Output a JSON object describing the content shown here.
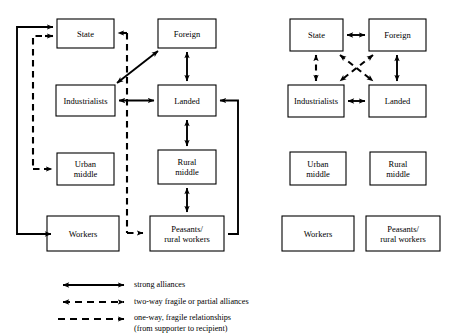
{
  "diagram": {
    "panels": [
      {
        "id": "left-panel",
        "name": "left-diagram",
        "nodes": [
          {
            "id": "state",
            "label": "State",
            "x": 57,
            "y": 19,
            "w": 57,
            "h": 29
          },
          {
            "id": "foreign",
            "label": "Foreign",
            "x": 158,
            "y": 19,
            "w": 58,
            "h": 29
          },
          {
            "id": "industrialists",
            "label": "Industrialists",
            "x": 56,
            "y": 85,
            "w": 59,
            "h": 31
          },
          {
            "id": "landed",
            "label": "Landed",
            "x": 158,
            "y": 85,
            "w": 58,
            "h": 31
          },
          {
            "id": "urban-middle",
            "label": "Urban\nmiddle",
            "x": 57,
            "y": 153,
            "w": 57,
            "h": 32
          },
          {
            "id": "rural-middle",
            "label": "Rural\nmiddle",
            "x": 158,
            "y": 150,
            "w": 58,
            "h": 34
          },
          {
            "id": "workers",
            "label": "Workers",
            "x": 47,
            "y": 216,
            "w": 72,
            "h": 35
          },
          {
            "id": "peasants",
            "label": "Peasants/\nrural workers",
            "x": 150,
            "y": 216,
            "w": 74,
            "h": 35
          }
        ],
        "edges": [
          {
            "from": "workers",
            "to": "state",
            "kind": "strong",
            "note": "loop left, double arrow into State"
          },
          {
            "from": "industrialists",
            "to": "foreign",
            "kind": "strong",
            "note": "diagonal"
          },
          {
            "from": "industrialists",
            "to": "landed",
            "kind": "strong"
          },
          {
            "from": "foreign",
            "to": "landed",
            "kind": "strong"
          },
          {
            "from": "landed",
            "to": "rural-middle",
            "kind": "strong"
          },
          {
            "from": "rural-middle",
            "to": "peasants",
            "kind": "strong"
          },
          {
            "from": "peasants",
            "to": "landed",
            "kind": "strong",
            "note": "right side loop"
          },
          {
            "from": "foreign",
            "to": "state",
            "kind": "one-way-fragile"
          },
          {
            "from": "foreign",
            "to": "urban-middle",
            "kind": "one-way-fragile"
          },
          {
            "from": "foreign",
            "to": "peasants",
            "kind": "one-way-fragile"
          }
        ]
      },
      {
        "id": "right-panel",
        "name": "right-diagram",
        "nodes": [
          {
            "id": "state",
            "label": "State",
            "x": 290,
            "y": 19,
            "w": 53,
            "h": 32
          },
          {
            "id": "foreign",
            "label": "Foreign",
            "x": 369,
            "y": 19,
            "w": 57,
            "h": 32
          },
          {
            "id": "industrialists",
            "label": "Industrialists",
            "x": 288,
            "y": 85,
            "w": 56,
            "h": 32
          },
          {
            "id": "landed",
            "label": "Landed",
            "x": 369,
            "y": 85,
            "w": 57,
            "h": 32
          },
          {
            "id": "urban-middle",
            "label": "Urban\nmiddle",
            "x": 290,
            "y": 152,
            "w": 56,
            "h": 33
          },
          {
            "id": "rural-middle",
            "label": "Rural\nmiddle",
            "x": 370,
            "y": 152,
            "w": 56,
            "h": 33
          },
          {
            "id": "workers",
            "label": "Workers",
            "x": 282,
            "y": 216,
            "w": 72,
            "h": 35
          },
          {
            "id": "peasants",
            "label": "Peasants/\nrural workers",
            "x": 366,
            "y": 216,
            "w": 74,
            "h": 35
          }
        ],
        "edges": [
          {
            "from": "state",
            "to": "foreign",
            "kind": "strong"
          },
          {
            "from": "industrialists",
            "to": "landed",
            "kind": "strong"
          },
          {
            "from": "foreign",
            "to": "landed",
            "kind": "strong"
          },
          {
            "from": "state",
            "to": "industrialists",
            "kind": "two-way-fragile"
          },
          {
            "from": "state",
            "to": "landed",
            "kind": "two-way-fragile",
            "note": "diagonal crossing"
          },
          {
            "from": "foreign",
            "to": "industrialists",
            "kind": "two-way-fragile",
            "note": "diagonal crossing"
          }
        ]
      }
    ]
  },
  "legend": {
    "name": "legend",
    "items": [
      {
        "id": "strong",
        "style": "solid-double-arrow",
        "label": "strong alliances"
      },
      {
        "id": "two-way-fragile",
        "style": "dashed-double-arrow",
        "label": "two-way fragile or partial alliances"
      },
      {
        "id": "one-way-fragile",
        "style": "dashed-single-arrow",
        "label": "one-way, fragile relationships\n(from supporter to recipient)"
      }
    ]
  },
  "style": {
    "line_color": "#000000",
    "box_border": "#000000",
    "background": "#ffffff"
  }
}
